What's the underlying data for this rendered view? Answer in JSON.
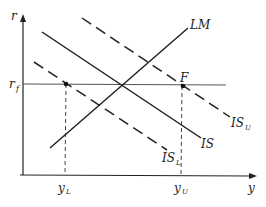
{
  "diagram": {
    "type": "IS-LM",
    "axes": {
      "x_label": "y",
      "y_label": "r"
    },
    "curves": {
      "lm": "LM",
      "is": "IS",
      "is_lower": "IS",
      "is_lower_sub": "L",
      "is_upper": "IS",
      "is_upper_sub": "U"
    },
    "rate_line": {
      "label": "r",
      "sub": "f"
    },
    "point_label": "F",
    "x_ticks": {
      "low": "y",
      "low_sub": "L",
      "high": "y",
      "high_sub": "U"
    },
    "colors": {
      "line": "#222222",
      "rate_line": "#555555"
    }
  }
}
